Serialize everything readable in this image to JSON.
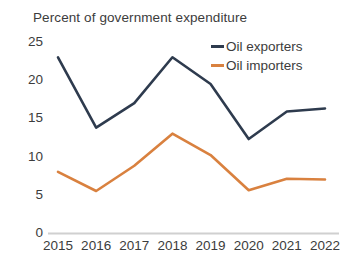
{
  "chart_data": {
    "type": "line",
    "title": "Percent of government expenditure",
    "xlabel": "",
    "ylabel": "",
    "categories": [
      "2015",
      "2016",
      "2017",
      "2018",
      "2019",
      "2020",
      "2021",
      "2022"
    ],
    "x": [
      2015,
      2016,
      2017,
      2018,
      2019,
      2020,
      2021,
      2022
    ],
    "ylim": [
      0,
      25
    ],
    "yticks": [
      0,
      5,
      10,
      15,
      20,
      25
    ],
    "ytick_labels": [
      "0",
      "5",
      "10",
      "15",
      "20",
      "25"
    ],
    "grid": false,
    "legend_position": "top-right",
    "series": [
      {
        "name": "Oil exporters",
        "color": "#2e3b4e",
        "values": [
          23.0,
          13.8,
          17.0,
          23.0,
          19.5,
          12.3,
          15.9,
          16.3
        ]
      },
      {
        "name": "Oil importers",
        "color": "#d9813f",
        "values": [
          8.0,
          5.5,
          8.8,
          13.0,
          10.2,
          5.6,
          7.1,
          7.0
        ]
      }
    ]
  },
  "axis": {
    "baseline_color": "#d0d0d0"
  }
}
